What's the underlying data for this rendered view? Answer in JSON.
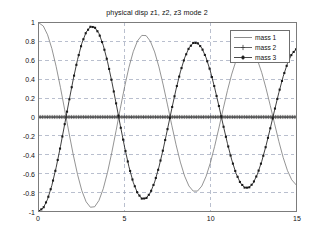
{
  "figure": {
    "title": "physical disp z1, z2, z3 mode 2",
    "background_color": "#ffffff",
    "axes_color": "#7c7c7c",
    "grid_color": "#9aa3b8"
  },
  "legend": {
    "position": "top-right",
    "entries": [
      {
        "label": "mass 1",
        "marker": "none",
        "color": "#6e6e6e"
      },
      {
        "label": "mass 2",
        "marker": "plus",
        "color": "#3a3a3a"
      },
      {
        "label": "mass 3",
        "marker": "filled",
        "color": "#1a1a1a"
      }
    ]
  },
  "axis": {
    "x": {
      "label": "",
      "min": 0,
      "max": 15,
      "ticks": [
        0,
        5,
        10,
        15
      ],
      "tick_labels": [
        "0",
        "5",
        "10",
        "15"
      ]
    },
    "y": {
      "label": "",
      "min": -1,
      "max": 1,
      "ticks": [
        1,
        0.8,
        0.6,
        0.4,
        0.2,
        0,
        -0.2,
        -0.4,
        -0.6,
        -0.8,
        -1
      ],
      "tick_labels": [
        "1",
        "0.8",
        "0.6",
        "0.4",
        "0.2",
        "0",
        "-0.2",
        "-0.4",
        "-0.6",
        "-0.8",
        "-1"
      ]
    }
  },
  "chart_data": {
    "type": "line",
    "title": "physical disp z1, z2, z3 mode 2",
    "xlabel": "",
    "ylabel": "",
    "xlim": [
      0,
      15
    ],
    "ylim": [
      -1,
      1
    ],
    "grid": true,
    "legend_position": "top-right",
    "x": [
      0,
      0.25,
      0.5,
      0.75,
      1,
      1.25,
      1.5,
      1.75,
      2,
      2.25,
      2.5,
      2.75,
      3,
      3.25,
      3.5,
      3.75,
      4,
      4.25,
      4.5,
      4.75,
      5,
      5.25,
      5.5,
      5.75,
      6,
      6.25,
      6.5,
      6.75,
      7,
      7.25,
      7.5,
      7.75,
      8,
      8.25,
      8.5,
      8.75,
      9,
      9.25,
      9.5,
      9.75,
      10,
      10.25,
      10.5,
      10.75,
      11,
      11.25,
      11.5,
      11.75,
      12,
      12.25,
      12.5,
      12.75,
      13,
      13.25,
      13.5,
      13.75,
      14,
      14.25,
      14.5,
      14.75,
      15
    ],
    "series": [
      {
        "name": "mass 1",
        "marker": "none",
        "color": "#6e6e6e",
        "values": [
          1,
          0.968,
          0.875,
          0.728,
          0.538,
          0.316,
          0.076,
          -0.168,
          -0.402,
          -0.612,
          -0.784,
          -0.902,
          -0.96,
          -0.955,
          -0.888,
          -0.763,
          -0.588,
          -0.377,
          -0.145,
          0.094,
          0.324,
          0.529,
          0.695,
          0.81,
          0.868,
          0.866,
          0.806,
          0.692,
          0.533,
          0.341,
          0.129,
          -0.088,
          -0.296,
          -0.48,
          -0.629,
          -0.734,
          -0.788,
          -0.788,
          -0.735,
          -0.632,
          -0.489,
          -0.313,
          -0.117,
          0.086,
          0.282,
          0.457,
          0.6,
          0.7,
          0.751,
          0.752,
          0.703,
          0.607,
          0.472,
          0.306,
          0.12,
          -0.073,
          -0.26,
          -0.43,
          -0.569,
          -0.668,
          -0.72
        ]
      },
      {
        "name": "mass 2",
        "marker": "plus",
        "color": "#3a3a3a",
        "values": [
          0,
          0,
          0,
          0,
          0,
          0,
          0,
          0,
          0,
          0,
          0,
          0,
          0,
          0,
          0,
          0,
          0,
          0,
          0,
          0,
          0,
          0,
          0,
          0,
          0,
          0,
          0,
          0,
          0,
          0,
          0,
          0,
          0,
          0,
          0,
          0,
          0,
          0,
          0,
          0,
          0,
          0,
          0,
          0,
          0,
          0,
          0,
          0,
          0,
          0,
          0,
          0,
          0,
          0,
          0,
          0,
          0,
          0,
          0,
          0,
          0
        ]
      },
      {
        "name": "mass 3",
        "marker": "filled",
        "color": "#1a1a1a",
        "values": [
          -1,
          -0.968,
          -0.875,
          -0.728,
          -0.538,
          -0.316,
          -0.076,
          0.168,
          0.402,
          0.612,
          0.784,
          0.902,
          0.96,
          0.955,
          0.888,
          0.763,
          0.588,
          0.377,
          0.145,
          -0.094,
          -0.324,
          -0.529,
          -0.695,
          -0.81,
          -0.868,
          -0.866,
          -0.806,
          -0.692,
          -0.533,
          -0.341,
          -0.129,
          0.088,
          0.296,
          0.48,
          0.629,
          0.734,
          0.788,
          0.788,
          0.735,
          0.632,
          0.489,
          0.313,
          0.117,
          -0.086,
          -0.282,
          -0.457,
          -0.6,
          -0.7,
          -0.751,
          -0.752,
          -0.703,
          -0.607,
          -0.472,
          -0.306,
          -0.12,
          0.073,
          0.26,
          0.43,
          0.569,
          0.668,
          0.72
        ]
      }
    ],
    "notes": {
      "period_estimate": 6.3,
      "amplitude_peaks_mass3": [
        0.93,
        0.87,
        0.82,
        0.8
      ],
      "mass2_constant_value": 0
    }
  }
}
